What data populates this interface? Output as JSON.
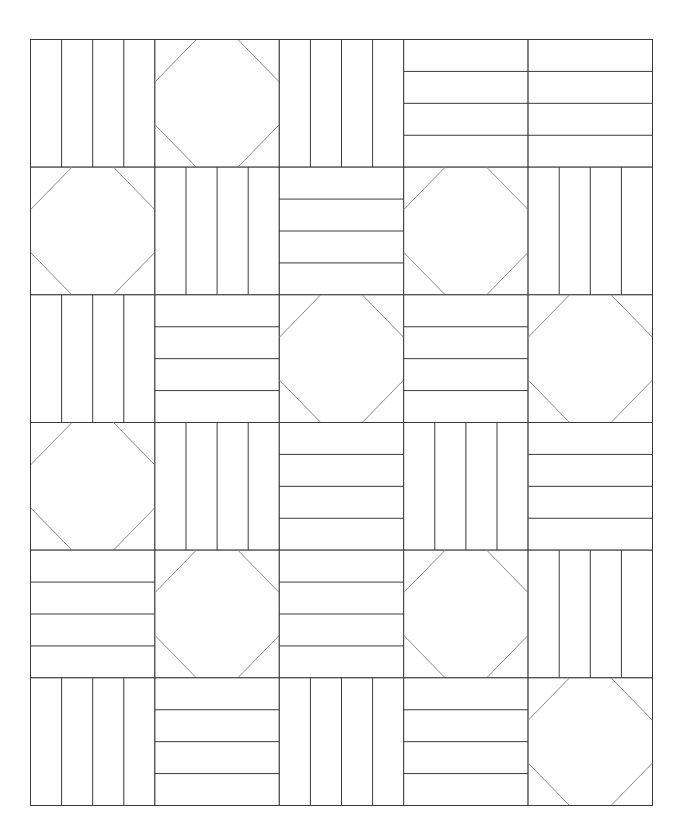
{
  "quilt": {
    "rows": 6,
    "cols": 5,
    "origin": [
      30.5,
      39.5
    ],
    "size": [
      622,
      766
    ],
    "strips_per_block": 4,
    "octagon_cut_fraction": 0.333,
    "colors": {
      "background": "#ffffff",
      "seam_line": "#3a3a3a",
      "octagon_diagonal": "#8a8a8a"
    },
    "legend": {
      "V": "vertical-rail-block",
      "H": "horizontal-rail-block",
      "O": "snowball-octagon-block"
    },
    "layout": [
      [
        "V",
        "O",
        "V",
        "H",
        "H"
      ],
      [
        "O",
        "V",
        "H",
        "O",
        "V"
      ],
      [
        "V",
        "H",
        "O",
        "H",
        "O"
      ],
      [
        "O",
        "V",
        "H",
        "V",
        "H"
      ],
      [
        "H",
        "O",
        "H",
        "O",
        "V"
      ],
      [
        "V",
        "H",
        "V",
        "H",
        "O"
      ]
    ]
  }
}
